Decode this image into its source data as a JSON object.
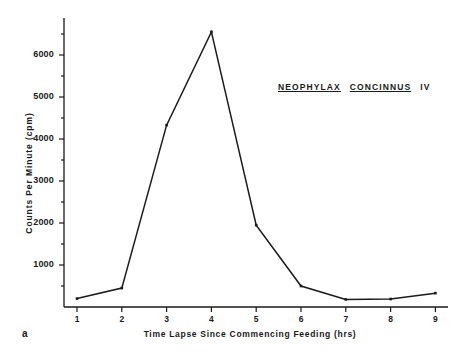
{
  "figure": {
    "panel_letter": "a",
    "annotation": {
      "genus": "NEOPHYLAX",
      "species": "CONCINNUS",
      "instar": "IV"
    }
  },
  "chart_data": {
    "type": "line",
    "xlabel": "Time  Lapse  Since  Commencing  Feeding  (hrs)",
    "ylabel": "Counts  Per  Minute  (cpm)",
    "x": [
      1,
      2,
      3,
      4,
      5,
      6,
      7,
      8,
      9
    ],
    "values": [
      200,
      450,
      4330,
      6550,
      1950,
      500,
      180,
      190,
      330
    ],
    "xtick_labels": [
      "1",
      "2",
      "3",
      "4",
      "5",
      "6",
      "7",
      "8",
      "9"
    ],
    "ytick_labels": [
      "1000",
      "2000",
      "3000",
      "4000",
      "5000",
      "6000"
    ],
    "ytick_values": [
      1000,
      2000,
      3000,
      4000,
      5000,
      6000
    ],
    "xlim": [
      0.5,
      9.4
    ],
    "ylim": [
      0,
      6900
    ],
    "grid": false,
    "legend": false,
    "line_color": "#1a1a1a",
    "marker": "point"
  }
}
